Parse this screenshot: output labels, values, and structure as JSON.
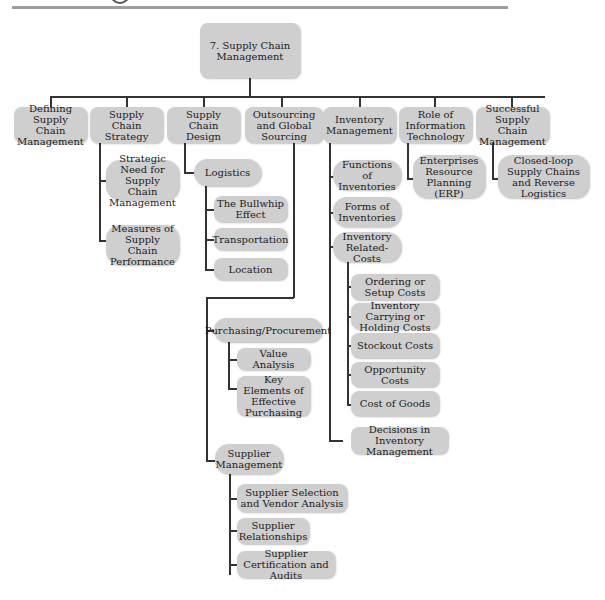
{
  "root": {
    "label": "7. Supply Chain Management"
  },
  "level1": [
    {
      "label": "Defining Supply Chain Management"
    },
    {
      "label": "Supply Chain Strategy"
    },
    {
      "label": "Supply Chain Design"
    },
    {
      "label": "Outsourcing and Global Sourcing"
    },
    {
      "label": "Inventory Management"
    },
    {
      "label": "Role of Information Technology"
    },
    {
      "label": "Successful Supply Chain Management"
    }
  ],
  "strategy_children": [
    {
      "label": "Strategic Need for Supply Chain Management"
    },
    {
      "label": "Measures of Supply Chain Performance"
    }
  ],
  "design_children": {
    "logistics": {
      "label": "Logistics"
    },
    "logistics_children": [
      {
        "label": "The Bullwhip Effect"
      },
      {
        "label": "Transportation"
      },
      {
        "label": "Location"
      }
    ]
  },
  "outsourcing_children": {
    "purchasing": {
      "label": "Purchasing/Procurement"
    },
    "purchasing_children": [
      {
        "label": "Value Analysis"
      },
      {
        "label": "Key Elements of Effective Purchasing"
      }
    ],
    "supplier_mgmt": {
      "label": "Supplier Management"
    },
    "supplier_children": [
      {
        "label": "Supplier Selection and Vendor Analysis"
      },
      {
        "label": "Supplier Relationships"
      },
      {
        "label": "Supplier Certification and Audits"
      }
    ]
  },
  "inventory_children": {
    "functions": {
      "label": "Functions of Inventories"
    },
    "forms": {
      "label": "Forms of Inventories"
    },
    "related_costs": {
      "label": "Inventory Related-Costs"
    },
    "cost_children": [
      {
        "label": "Ordering or Setup Costs"
      },
      {
        "label": "Inventory Carrying or Holding Costs"
      },
      {
        "label": "Stockout Costs"
      },
      {
        "label": "Opportunity Costs"
      },
      {
        "label": "Cost of Goods"
      }
    ],
    "decisions": {
      "label": "Decisions in Inventory Management"
    }
  },
  "it_children": [
    {
      "label": "Enterprises Resource Planning (ERP)"
    }
  ],
  "success_children": [
    {
      "label": "Closed-loop Supply Chains and Reverse Logistics"
    }
  ]
}
